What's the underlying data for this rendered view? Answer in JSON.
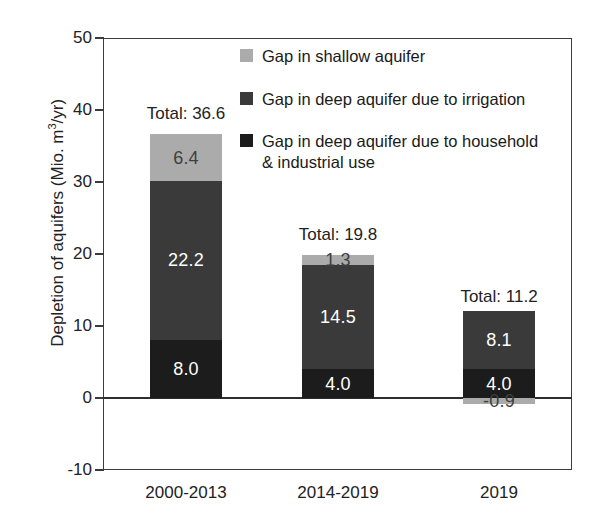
{
  "chart_data": {
    "type": "bar",
    "subtype": "stacked",
    "title": "",
    "xlabel": "",
    "ylabel": "Depletion of aquifers (Mio. m3/yr)",
    "ylabel_display": "Depletion of aquifers (Mio. m",
    "ylabel_sup": "3",
    "ylabel_tail": "/yr)",
    "categories": [
      "2000-2013",
      "2014-2019",
      "2019"
    ],
    "ylim": [
      -10,
      50
    ],
    "yticks": [
      -10,
      0,
      10,
      20,
      30,
      40,
      50
    ],
    "ytick_labels": [
      "-10",
      "0",
      "10",
      "20",
      "30",
      "40",
      "50"
    ],
    "grid": false,
    "legend_position": "upper right inside",
    "series": [
      {
        "name": "Gap in deep aquifer due to household & industrial use",
        "color": "#1c1c1c",
        "values": [
          8.0,
          4.0,
          4.0
        ],
        "labels": [
          "8.0",
          "4.0",
          "4.0"
        ]
      },
      {
        "name": "Gap in deep aquifer due to irrigation",
        "color": "#3a3a3a",
        "values": [
          22.2,
          14.5,
          8.1
        ],
        "labels": [
          "22.2",
          "14.5",
          "8.1"
        ]
      },
      {
        "name": "Gap in shallow aquifer",
        "color": "#ababab",
        "values": [
          6.4,
          1.3,
          -0.9
        ],
        "labels": [
          "6.4",
          "1.3",
          "-0.9"
        ]
      }
    ],
    "totals": [
      36.6,
      19.8,
      11.2
    ],
    "total_labels": [
      "Total: 36.6",
      "Total: 19.8",
      "Total: 11.2"
    ]
  },
  "legend": {
    "items": [
      {
        "label": "Gap in shallow aquifer",
        "color": "#ababab"
      },
      {
        "label": "Gap in deep aquifer due to irrigation",
        "color": "#3a3a3a"
      },
      {
        "label": "Gap in deep aquifer due to household\n& industrial use",
        "color": "#1c1c1c"
      }
    ]
  }
}
